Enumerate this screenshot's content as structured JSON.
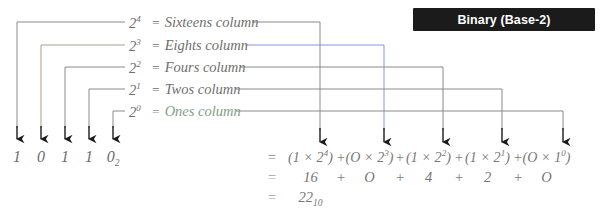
{
  "header": {
    "badge_label": "Binary (Base-2)",
    "badge_bg": "#1b1b1b",
    "badge_text_color": "#ffffff"
  },
  "colors": {
    "background": "#ffffff",
    "wire_gray": "#8a8a8a",
    "wire_blue": "#8c93d8",
    "wire_olive": "#a9a183",
    "arrow_black": "#1a1a1a",
    "text_gray": "#6f6f6f",
    "text_green": "#8fae92"
  },
  "place_values": [
    {
      "power_base": "2",
      "exponent": "4",
      "equals": "=",
      "name": "Sixteens column",
      "right_wire_color": "#8a8a8a"
    },
    {
      "power_base": "2",
      "exponent": "3",
      "equals": "=",
      "name": "Eights column",
      "right_wire_color": "#8c93d8"
    },
    {
      "power_base": "2",
      "exponent": "2",
      "equals": "=",
      "name": "Fours column",
      "right_wire_color": "#8a8a8a"
    },
    {
      "power_base": "2",
      "exponent": "1",
      "equals": "=",
      "name": "Twos column",
      "right_wire_color": "#8a8a8a"
    },
    {
      "power_base": "2",
      "exponent": "0",
      "equals": "=",
      "name": "Ones column",
      "right_wire_color": "#8a8a8a"
    }
  ],
  "binary_number": {
    "digits": [
      "1",
      "0",
      "1",
      "1",
      "0"
    ],
    "subscript": "2",
    "full": "10110"
  },
  "equation": {
    "line1": {
      "sign": "=",
      "terms": [
        "(1 × 2⁴)",
        "(0 × 2³)",
        "(1 × 2²)",
        "(1 × 2¹)",
        "(0 × 1⁰)"
      ],
      "term_parts": [
        {
          "open": "(",
          "coef": "1",
          "times": "×",
          "base": "2",
          "exp": "4",
          "close": ")"
        },
        {
          "open": "(",
          "coef": "O",
          "times": "×",
          "base": "2",
          "exp": "3",
          "close": ")"
        },
        {
          "open": "(",
          "coef": "1",
          "times": "×",
          "base": "2",
          "exp": "2",
          "close": ")"
        },
        {
          "open": "(",
          "coef": "1",
          "times": "×",
          "base": "2",
          "exp": "1",
          "close": ")"
        },
        {
          "open": "(",
          "coef": "O",
          "times": "×",
          "base": "1",
          "exp": "0",
          "close": ")"
        }
      ],
      "plus": "+"
    },
    "line2": {
      "sign": "=",
      "values": [
        "16",
        "O",
        "4",
        "2",
        "O"
      ],
      "plus": "+"
    },
    "line3": {
      "sign": "=",
      "result": "22",
      "subscript": "10"
    }
  },
  "icons": {
    "down_arrow": "down-arrow-icon"
  }
}
